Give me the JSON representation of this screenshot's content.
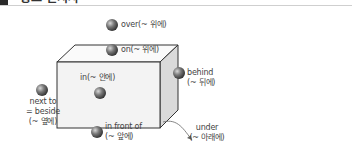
{
  "header": {
    "title": "장소 전치사"
  },
  "diagram": {
    "labels": {
      "over": "over(~ 위에)",
      "on": "on(~ 위에)",
      "in": "in(~ 안에)",
      "behind_1": "behind",
      "behind_2": "(~ 뒤에)",
      "next_1": "next to",
      "next_2": "= beside",
      "next_3": "(~ 옆에)",
      "front_1": "in front of",
      "front_2": "(~ 앞에)",
      "under_1": "under",
      "under_2": "(~ 아래에)"
    },
    "colors": {
      "box_front": "#f4f4f4",
      "box_top": "#fafafa",
      "box_side": "#dcdcdc",
      "box_stroke": "#333333",
      "ball": "#6a6a6a"
    }
  }
}
